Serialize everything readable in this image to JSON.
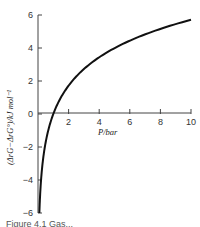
{
  "chart_data": {
    "type": "line",
    "title": "",
    "xlabel": "P/bar",
    "ylabel": "(ΔrG−ΔrG°)/kJ mol⁻¹",
    "xlim": [
      0,
      10
    ],
    "ylim": [
      -6,
      6
    ],
    "x_ticks": [
      2,
      4,
      6,
      8,
      10
    ],
    "y_ticks": [
      -6,
      -4,
      -2,
      0,
      2,
      4,
      6
    ],
    "grid": false,
    "legend": null,
    "series": [
      {
        "name": "RT ln P",
        "x": [
          0.089,
          0.15,
          0.25,
          0.4,
          0.6,
          0.8,
          1.0,
          1.5,
          2,
          3,
          4,
          5,
          6,
          7,
          8,
          9,
          10
        ],
        "y": [
          -6.0,
          -4.7,
          -3.44,
          -2.27,
          -1.27,
          -0.55,
          0.0,
          1.0,
          1.72,
          2.72,
          3.44,
          3.99,
          4.44,
          4.82,
          5.15,
          5.45,
          5.71
        ]
      }
    ]
  },
  "axes": {
    "x_title": "P/bar",
    "y_title": "(ΔrG−ΔrG°)/kJ mol⁻¹"
  },
  "caption": "Figure 4.1  Gas..."
}
